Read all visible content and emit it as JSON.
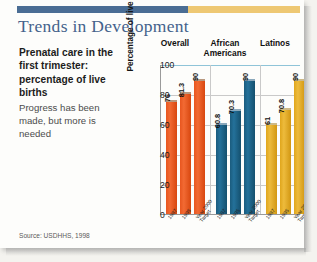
{
  "slide": {
    "title": "Trends in Development",
    "rule_blue_color": "#4a6d94",
    "rule_gold_color": "#eec873"
  },
  "copy": {
    "lead": "Prenatal care in the first trimester: percentage of live births",
    "sub": "Progress has been made, but more is needed"
  },
  "source": "Source: USDHHS, 1998",
  "chart_data": {
    "type": "bar",
    "title": "",
    "xlabel": "",
    "ylabel": "Percentage of live births",
    "ylim": [
      0,
      100
    ],
    "yticks": [
      "0",
      "20",
      "40",
      "60",
      "80",
      "100"
    ],
    "grid": true,
    "legend_position": "none",
    "categories": [
      "Overall",
      "African Americans",
      "Latinos"
    ],
    "series": [
      {
        "name": "1987",
        "values": [
          76,
          60.8,
          61
        ]
      },
      {
        "name": "1995",
        "values": [
          81.3,
          70.3,
          70.8
        ]
      },
      {
        "name": "Year 2000 Target",
        "values": [
          90,
          90,
          90
        ]
      }
    ],
    "bars": [
      {
        "group": "Overall",
        "x": "1987",
        "value": 76,
        "label": "76",
        "color": "#e8561f"
      },
      {
        "group": "Overall",
        "x": "1995",
        "value": 81.3,
        "label": "81.3",
        "color": "#e8561f"
      },
      {
        "group": "Overall",
        "x": "Year 2000 Target",
        "value": 90,
        "label": "90",
        "color": "#e8561f"
      },
      {
        "group": "African Americans",
        "x": "1987",
        "value": 60.8,
        "label": "60.8",
        "color": "#1b5c7e"
      },
      {
        "group": "African Americans",
        "x": "1995",
        "value": 70.3,
        "label": "70.3",
        "color": "#1b5c7e"
      },
      {
        "group": "African Americans",
        "x": "Year 2000 Target",
        "value": 90,
        "label": "90",
        "color": "#1b5c7e"
      },
      {
        "group": "Latinos",
        "x": "1987",
        "value": 61,
        "label": "61",
        "color": "#e0a61c"
      },
      {
        "group": "Latinos",
        "x": "1995",
        "value": 70.8,
        "label": "70.8",
        "color": "#e0a61c"
      },
      {
        "group": "Latinos",
        "x": "Year 2000 Target",
        "value": 90,
        "label": "90",
        "color": "#e0a61c"
      }
    ],
    "xtick_labels": [
      "1987",
      "1995",
      "Year 2000\nTarget",
      "1987",
      "1995",
      "Year 2000\nTarget",
      "1987",
      "1995",
      "Year 2000\nTarget"
    ]
  }
}
